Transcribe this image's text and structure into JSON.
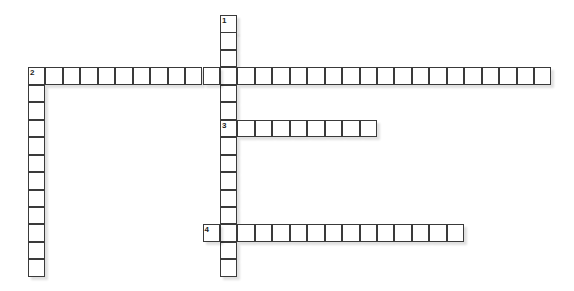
{
  "puzzle": {
    "cell_size": 17.45,
    "origin_x": 28,
    "origin_y": 15,
    "words": [
      {
        "number": "1",
        "direction": "down",
        "col": 11,
        "row": 0,
        "length": 15
      },
      {
        "number": "2",
        "direction": "across",
        "col": 0,
        "row": 3,
        "length": 30
      },
      {
        "number": "2",
        "direction": "down",
        "col": 0,
        "row": 3,
        "length": 12
      },
      {
        "number": "3",
        "direction": "across",
        "col": 11,
        "row": 6,
        "length": 9
      },
      {
        "number": "4",
        "direction": "across",
        "col": 10,
        "row": 12,
        "length": 15
      }
    ]
  }
}
